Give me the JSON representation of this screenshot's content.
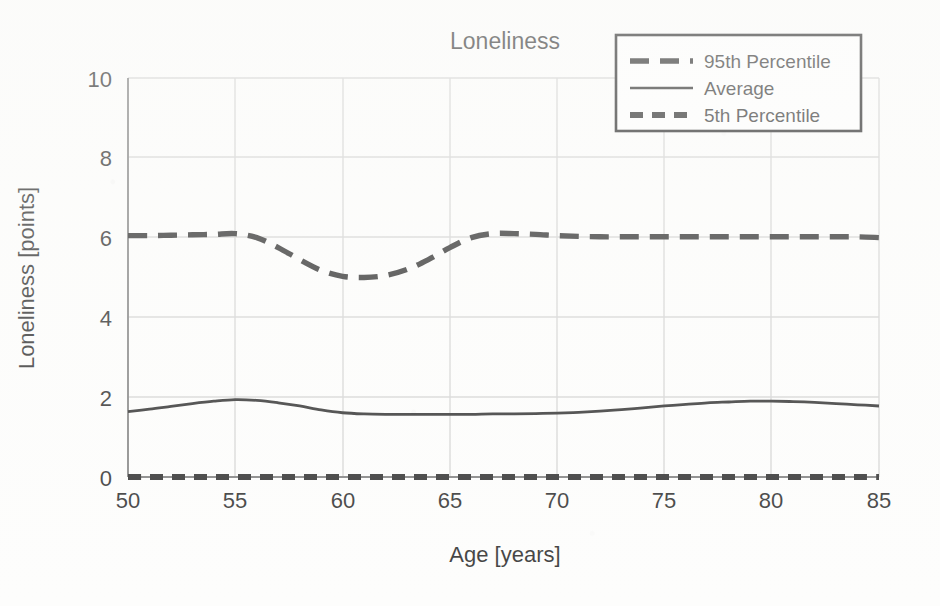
{
  "chart_data": {
    "type": "line",
    "title": "Loneliness",
    "xlabel": "Age [years]",
    "ylabel": "Loneliness [points]",
    "xlim": [
      50,
      85
    ],
    "ylim": [
      0,
      10
    ],
    "xticks": [
      50,
      55,
      60,
      65,
      70,
      75,
      80,
      85
    ],
    "yticks": [
      0,
      2,
      4,
      6,
      8,
      10
    ],
    "grid": true,
    "legend_position": "top-right",
    "x": [
      50,
      51,
      52,
      53,
      54,
      55,
      56,
      57,
      58,
      59,
      60,
      61,
      62,
      63,
      64,
      65,
      66,
      67,
      68,
      69,
      70,
      71,
      72,
      73,
      74,
      75,
      76,
      77,
      78,
      79,
      80,
      81,
      82,
      83,
      84,
      85
    ],
    "series": [
      {
        "name": "95th Percentile",
        "style": "dashed-long",
        "color": "#111111",
        "values": [
          6.05,
          6.05,
          6.06,
          6.07,
          6.08,
          6.1,
          6.0,
          5.75,
          5.45,
          5.18,
          5.03,
          5.0,
          5.05,
          5.2,
          5.45,
          5.75,
          6.0,
          6.1,
          6.1,
          6.08,
          6.05,
          6.03,
          6.02,
          6.02,
          6.02,
          6.02,
          6.02,
          6.02,
          6.02,
          6.02,
          6.02,
          6.02,
          6.02,
          6.02,
          6.02,
          6.0
        ]
      },
      {
        "name": "Average",
        "style": "solid",
        "color": "#111111",
        "values": [
          1.64,
          1.7,
          1.77,
          1.84,
          1.9,
          1.94,
          1.92,
          1.86,
          1.78,
          1.68,
          1.61,
          1.58,
          1.57,
          1.57,
          1.57,
          1.57,
          1.57,
          1.58,
          1.58,
          1.59,
          1.6,
          1.62,
          1.65,
          1.69,
          1.73,
          1.78,
          1.82,
          1.86,
          1.88,
          1.9,
          1.9,
          1.89,
          1.87,
          1.84,
          1.81,
          1.78
        ]
      },
      {
        "name": "5th Percentile",
        "style": "dashed-short",
        "color": "#111111",
        "values": [
          0.0,
          0.0,
          0.0,
          0.0,
          0.0,
          0.0,
          0.0,
          0.0,
          0.0,
          0.0,
          0.0,
          0.0,
          0.0,
          0.0,
          0.0,
          0.0,
          0.0,
          0.0,
          0.0,
          0.0,
          0.0,
          0.0,
          0.0,
          0.0,
          0.0,
          0.0,
          0.0,
          0.0,
          0.0,
          0.0,
          0.0,
          0.0,
          0.0,
          0.0,
          0.0,
          0.0
        ]
      }
    ]
  },
  "legend": {
    "items": [
      {
        "label": "95th Percentile"
      },
      {
        "label": "Average"
      },
      {
        "label": "5th Percentile"
      }
    ]
  },
  "axes": {
    "x_tick_labels": [
      "50",
      "55",
      "60",
      "65",
      "70",
      "75",
      "80",
      "85"
    ],
    "y_tick_labels": [
      "0",
      "2",
      "4",
      "6",
      "8",
      "10"
    ]
  }
}
